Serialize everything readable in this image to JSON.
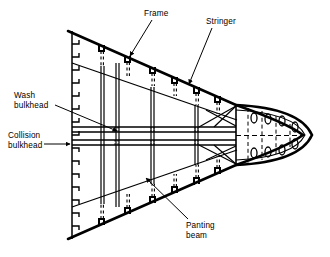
{
  "figure": {
    "kind": "engineering-diagram",
    "background_color": "#ffffff",
    "line_color": "#000000"
  },
  "labels": {
    "frame": "Frame",
    "stringer": "Stringer",
    "wash_bulkhead_line1": "Wash",
    "wash_bulkhead_line2": "bulkhead",
    "collision_bulkhead_line1": "Collision",
    "collision_bulkhead_line2": "bulkhead",
    "panting_beam_line1": "Panting",
    "panting_beam_line2": "beam"
  },
  "geometry": {
    "centerline_y": 135,
    "stern_edge_x": 72,
    "stern_top_y": 31,
    "stern_bottom_y": 239,
    "nose_tip_x": 316,
    "nose_bulkhead_x": 236,
    "hull_top_path": "M 68,31 L 236,105 Q 286,123 302,135",
    "hull_bottom_path": "M 68,239 L 236,165 Q 286,147 302,135",
    "stringer_top_path": "M 72,63 L 236,120",
    "stringer_bottom_path": "M 72,207 L 236,150"
  },
  "structure": {
    "frames_top": [
      {
        "x": 101,
        "hull_y": 44
      },
      {
        "x": 127,
        "hull_y": 55
      },
      {
        "x": 152,
        "hull_y": 66
      },
      {
        "x": 174,
        "hull_y": 76
      },
      {
        "x": 196,
        "hull_y": 85
      },
      {
        "x": 217,
        "hull_y": 95
      }
    ],
    "frames_bottom": [
      {
        "x": 101,
        "hull_y": 226
      },
      {
        "x": 127,
        "hull_y": 215
      },
      {
        "x": 152,
        "hull_y": 204
      },
      {
        "x": 174,
        "hull_y": 194
      },
      {
        "x": 196,
        "hull_y": 185
      },
      {
        "x": 217,
        "hull_y": 175
      }
    ],
    "edge_ticks_count": 16,
    "bulkheads": [
      {
        "name": "wash-bulkhead",
        "x": 103
      },
      {
        "name": "collision-bulkhead",
        "x": 118
      },
      {
        "name": "transverse-web-1",
        "x": 152
      },
      {
        "name": "transverse-web-2",
        "x": 196
      },
      {
        "name": "forepeak-bulkhead",
        "x": 236
      }
    ],
    "panting_beams": [
      {
        "name": "upper-panting-beam",
        "y": 129
      },
      {
        "name": "lower-panting-beam",
        "y": 143
      }
    ],
    "nose_stringer_ribs_x": [
      248,
      262,
      276,
      290
    ],
    "nose_stringer_sections": [
      {
        "x": 253,
        "y": 117
      },
      {
        "x": 267,
        "y": 117
      },
      {
        "x": 281,
        "y": 117
      },
      {
        "x": 294,
        "y": 124
      },
      {
        "x": 253,
        "y": 153
      },
      {
        "x": 267,
        "y": 153
      },
      {
        "x": 281,
        "y": 153
      },
      {
        "x": 294,
        "y": 146
      }
    ],
    "breast_hooks_top": [
      "M 236,105 L 200,129",
      "M 236,105 L 214,129",
      "M 236,129 L 206,112"
    ],
    "breast_hooks_bottom": [
      "M 236,165 L 200,143",
      "M 236,165 L 214,143",
      "M 236,143 L 206,158"
    ]
  },
  "leaders": {
    "frame": {
      "text_x": 146,
      "text_y": 14,
      "path": "M 150,19 L 130,56",
      "arrow_at": [
        130,
        56
      ]
    },
    "stringer": {
      "text_x": 208,
      "text_y": 22,
      "path": "M 211,27 L 188,84",
      "arrow_at": [
        188,
        84
      ]
    },
    "wash_bulkhead": {
      "text_x": 16,
      "text_y": 100,
      "path": "M 56,106 L 116,131",
      "arrow_at": [
        116,
        131
      ]
    },
    "collision_bulkhead": {
      "text_x": 10,
      "text_y": 138,
      "path": "M 45,144 L 70,144",
      "arrow_at": [
        70,
        144
      ]
    },
    "panting_beam": {
      "text_x": 186,
      "text_y": 228,
      "path": "M 186,222 L 145,177",
      "arrow_at": [
        145,
        177
      ]
    }
  }
}
